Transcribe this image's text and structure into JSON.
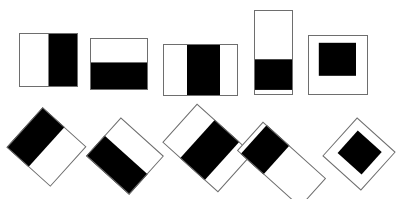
{
  "figure": {
    "canvas": {
      "width": 406,
      "height": 199
    },
    "colors": {
      "background": "#ffffff",
      "fill_black": "#000000",
      "fill_white": "#ffffff",
      "outline": "#6e6e6e"
    },
    "rows": [
      {
        "name": "upright-row",
        "label": "Upright orientation",
        "rotation_deg": 0
      },
      {
        "name": "rotated-row",
        "label": "Rotated orientation",
        "rotation_deg": 45
      }
    ],
    "shapes": [
      {
        "id": "tile-1-upright",
        "row": "upright-row",
        "index": 1,
        "label": "Square, right half black",
        "x": 19,
        "y": 33,
        "w": 59,
        "h": 54,
        "rotation_deg": 0,
        "bands": [
          {
            "orientation": "vertical",
            "start_pct": 0,
            "end_pct": 50,
            "color": "#ffffff"
          },
          {
            "orientation": "vertical",
            "start_pct": 50,
            "end_pct": 100,
            "color": "#000000"
          }
        ]
      },
      {
        "id": "tile-2-upright",
        "row": "upright-row",
        "index": 2,
        "label": "Wide rectangle, bottom half black",
        "x": 90,
        "y": 38,
        "w": 58,
        "h": 52,
        "rotation_deg": 0,
        "bands": [
          {
            "orientation": "horizontal",
            "start_pct": 0,
            "end_pct": 47,
            "color": "#ffffff"
          },
          {
            "orientation": "horizontal",
            "start_pct": 47,
            "end_pct": 100,
            "color": "#000000"
          }
        ]
      },
      {
        "id": "tile-3-upright",
        "row": "upright-row",
        "index": 3,
        "label": "Wide rectangle, central black vertical band",
        "x": 163,
        "y": 44,
        "w": 75,
        "h": 52,
        "rotation_deg": 0,
        "bands": [
          {
            "orientation": "vertical",
            "start_pct": 0,
            "end_pct": 32,
            "color": "#ffffff"
          },
          {
            "orientation": "vertical",
            "start_pct": 32,
            "end_pct": 76,
            "color": "#000000"
          },
          {
            "orientation": "vertical",
            "start_pct": 76,
            "end_pct": 100,
            "color": "#ffffff"
          }
        ]
      },
      {
        "id": "tile-4-upright",
        "row": "upright-row",
        "index": 4,
        "label": "Tall narrow rectangle, lower black band",
        "x": 254,
        "y": 10,
        "w": 39,
        "h": 85,
        "rotation_deg": 0,
        "bands": [
          {
            "orientation": "horizontal",
            "start_pct": 0,
            "end_pct": 58,
            "color": "#ffffff"
          },
          {
            "orientation": "horizontal",
            "start_pct": 58,
            "end_pct": 94,
            "color": "#000000"
          },
          {
            "orientation": "horizontal",
            "start_pct": 94,
            "end_pct": 100,
            "color": "#ffffff"
          }
        ]
      },
      {
        "id": "tile-5-upright",
        "row": "upright-row",
        "index": 5,
        "label": "Square with inset black square",
        "x": 308,
        "y": 35,
        "w": 60,
        "h": 60,
        "rotation_deg": 0,
        "inset": {
          "x_pct": 18,
          "y_pct": 13,
          "w_pct": 62,
          "h_pct": 55,
          "color": "#000000"
        }
      },
      {
        "id": "tile-1-rotated",
        "row": "rotated-row",
        "index": 1,
        "label": "Square, right half black, rotated",
        "x": 17,
        "y": 120,
        "w": 59,
        "h": 54,
        "rotation_deg": 42,
        "bands": [
          {
            "orientation": "vertical",
            "start_pct": 0,
            "end_pct": 50,
            "color": "#000000"
          },
          {
            "orientation": "vertical",
            "start_pct": 50,
            "end_pct": 100,
            "color": "#ffffff"
          }
        ]
      },
      {
        "id": "tile-2-rotated",
        "row": "rotated-row",
        "index": 2,
        "label": "Wide rectangle, bottom half black, rotated",
        "x": 96,
        "y": 130,
        "w": 58,
        "h": 52,
        "rotation_deg": 42,
        "bands": [
          {
            "orientation": "horizontal",
            "start_pct": 0,
            "end_pct": 47,
            "color": "#ffffff"
          },
          {
            "orientation": "horizontal",
            "start_pct": 47,
            "end_pct": 100,
            "color": "#000000"
          }
        ]
      },
      {
        "id": "tile-3-rotated",
        "row": "rotated-row",
        "index": 3,
        "label": "Wide rectangle, central black band, rotated",
        "x": 170,
        "y": 122,
        "w": 75,
        "h": 52,
        "rotation_deg": 42,
        "bands": [
          {
            "orientation": "vertical",
            "start_pct": 0,
            "end_pct": 32,
            "color": "#ffffff"
          },
          {
            "orientation": "vertical",
            "start_pct": 32,
            "end_pct": 76,
            "color": "#000000"
          },
          {
            "orientation": "vertical",
            "start_pct": 76,
            "end_pct": 100,
            "color": "#ffffff"
          }
        ]
      },
      {
        "id": "tile-4-rotated",
        "row": "rotated-row",
        "index": 4,
        "label": "Tall narrow rectangle, lower black band, rotated",
        "x": 262,
        "y": 122,
        "w": 39,
        "h": 85,
        "rotation_deg": 132,
        "bands": [
          {
            "orientation": "horizontal",
            "start_pct": 0,
            "end_pct": 58,
            "color": "#ffffff"
          },
          {
            "orientation": "horizontal",
            "start_pct": 58,
            "end_pct": 94,
            "color": "#000000"
          },
          {
            "orientation": "horizontal",
            "start_pct": 94,
            "end_pct": 100,
            "color": "#ffffff"
          }
        ]
      },
      {
        "id": "tile-5-rotated",
        "row": "rotated-row",
        "index": 5,
        "label": "Square with inset black square, rotated",
        "x": 333,
        "y": 128,
        "w": 52,
        "h": 52,
        "rotation_deg": 42,
        "inset": {
          "x_pct": 18,
          "y_pct": 18,
          "w_pct": 62,
          "h_pct": 58,
          "color": "#000000"
        }
      }
    ]
  }
}
